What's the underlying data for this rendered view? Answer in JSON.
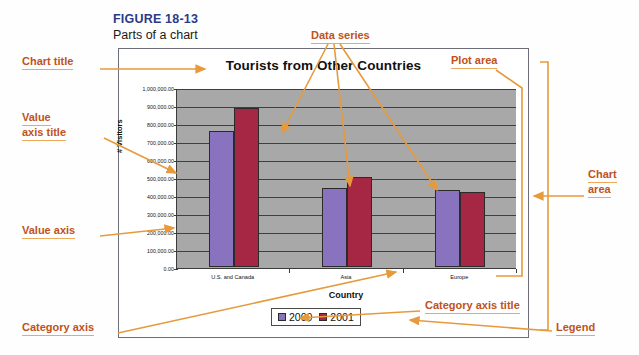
{
  "figure": {
    "number": "FIGURE 18-13",
    "caption": "Parts of a chart"
  },
  "chart_data": {
    "type": "bar",
    "title": "Tourists from Other Countries",
    "xlabel": "Country",
    "ylabel": "# Visitors",
    "categories": [
      "U.S. and Canada",
      "Asia",
      "Europe"
    ],
    "series": [
      {
        "name": "2000",
        "color": "#8a73be",
        "values": [
          755000,
          440000,
          430000
        ]
      },
      {
        "name": "2001",
        "color": "#a62744",
        "values": [
          885000,
          500000,
          415000
        ]
      }
    ],
    "ylim": [
      0,
      1000000
    ],
    "ytick_labels": [
      "1,000,000.00",
      "900,000.00",
      "800,000.00",
      "700,000.00",
      "600,000.00",
      "500,000.00",
      "400,000.00",
      "300,000.00",
      "200,000.00",
      "100,000.00",
      "0.00"
    ],
    "ytick_values": [
      1000000,
      900000,
      800000,
      700000,
      600000,
      500000,
      400000,
      300000,
      200000,
      100000,
      0
    ],
    "grid": true,
    "legend_position": "bottom",
    "plot_area_color": "#a8a8a8"
  },
  "annotations": {
    "chart_title": "Chart title",
    "value_axis_title_line1": "Value",
    "value_axis_title_line2": "axis title",
    "value_axis": "Value axis",
    "category_axis": "Category axis",
    "data_series": "Data series",
    "plot_area": "Plot area",
    "chart_area_line1": "Chart",
    "chart_area_line2": "area",
    "category_axis_title": "Category axis title",
    "legend": "Legend"
  },
  "colors": {
    "callout_text": "#c0521a",
    "callout_rule": "#eda85a",
    "leader_line": "#e79a3c",
    "figure_number": "#2b3a87",
    "series_2000": "#8a73be",
    "series_2001": "#a62744",
    "plot_background": "#a8a8a8"
  }
}
